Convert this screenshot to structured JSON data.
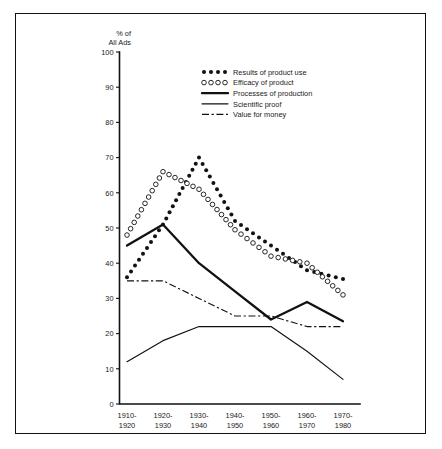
{
  "chart_data": {
    "type": "line",
    "title": "",
    "xlabel": "",
    "ylabel": "% of All Ads",
    "ylabel_line1": "% of",
    "ylabel_line2": "All Ads",
    "ylim": [
      0,
      100
    ],
    "ytick_step": 10,
    "yticks": [
      0,
      10,
      20,
      30,
      40,
      50,
      60,
      70,
      80,
      90,
      100
    ],
    "grid": false,
    "legend_position": "top-right-inside",
    "categories": [
      "1910-\n1920",
      "1920-\n1930",
      "1930-\n1940",
      "1940-\n1950",
      "1950-\n1960",
      "1960-\n1970",
      "1970-\n1980"
    ],
    "category_lines": [
      [
        "1910-",
        "1920"
      ],
      [
        "1920-",
        "1930"
      ],
      [
        "1930-",
        "1940"
      ],
      [
        "1940-",
        "1950"
      ],
      [
        "1950-",
        "1960"
      ],
      [
        "1960-",
        "1970"
      ],
      [
        "1970-",
        "1980"
      ]
    ],
    "series": [
      {
        "name": "Results of product use",
        "style": "dotted-filled",
        "marker": "filled-circle",
        "values": [
          36,
          51,
          70,
          52,
          45,
          38,
          35.5
        ]
      },
      {
        "name": "Efficacy of product",
        "style": "dotted-open",
        "marker": "open-circle",
        "values": [
          48,
          66,
          61,
          49.5,
          42,
          40,
          31
        ]
      },
      {
        "name": "Processes of production",
        "style": "bold-line",
        "marker": "none",
        "values": [
          45,
          51,
          40,
          32,
          24,
          29,
          23.5
        ]
      },
      {
        "name": "Scientific proof",
        "style": "thin-line",
        "marker": "none",
        "values": [
          12,
          18,
          22,
          22,
          22,
          15,
          7
        ]
      },
      {
        "name": "Value for money",
        "style": "dashdot-line",
        "marker": "none",
        "values": [
          35,
          35,
          30,
          25,
          25,
          22,
          22
        ]
      }
    ],
    "legend": [
      {
        "label": "Results of product use",
        "swatch": "dots-filled"
      },
      {
        "label": "Efficacy of product",
        "swatch": "dots-open"
      },
      {
        "label": "Processes of production",
        "swatch": "bold-line"
      },
      {
        "label": "Scientific proof",
        "swatch": "thin-line"
      },
      {
        "label": "Value for money",
        "swatch": "dashdot-line"
      }
    ],
    "colors": {
      "ink": "#111111",
      "background": "#ffffff"
    }
  }
}
